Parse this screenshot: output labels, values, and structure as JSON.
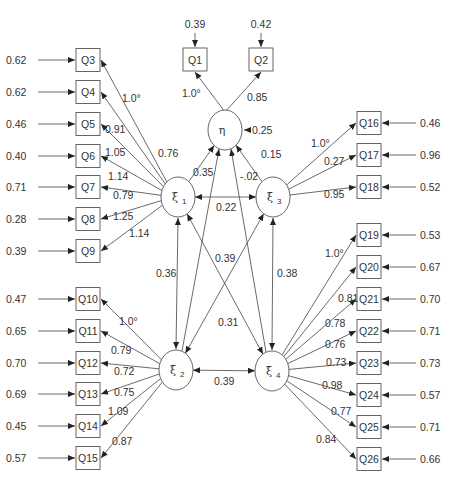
{
  "diagram": {
    "type": "structural-equation-model",
    "latents": [
      {
        "id": "eta",
        "label": "η",
        "cx": 225,
        "cy": 130,
        "error": "0.25"
      },
      {
        "id": "xi1",
        "label": "ξ",
        "sub": "1",
        "cx": 178,
        "cy": 197
      },
      {
        "id": "xi3",
        "label": "ξ",
        "sub": "3",
        "cx": 273,
        "cy": 197
      },
      {
        "id": "xi2",
        "label": "ξ",
        "sub": "2",
        "cx": 176,
        "cy": 370
      },
      {
        "id": "xi4",
        "label": "ξ",
        "sub": "4",
        "cx": 272,
        "cy": 371
      }
    ],
    "indicators_eta": [
      {
        "label": "Q1",
        "x": 183,
        "y": 48,
        "error": "0.39",
        "loading": "1.0*",
        "lx": 182,
        "ly": 97
      },
      {
        "label": "Q2",
        "x": 249,
        "y": 48,
        "error": "0.42",
        "loading": "0.85",
        "lx": 247,
        "ly": 101
      }
    ],
    "indicators_xi1": [
      {
        "label": "Q3",
        "cy": 60,
        "error": "0.62",
        "loading": "1.0*",
        "lx": 122,
        "ly": 102
      },
      {
        "label": "Q4",
        "cy": 92,
        "error": "0.62",
        "loading": "0.91",
        "lx": 105,
        "ly": 133
      },
      {
        "label": "Q5",
        "cy": 124,
        "error": "0.46",
        "loading": "1.05",
        "lx": 105,
        "ly": 156
      },
      {
        "label": "Q6",
        "cy": 156,
        "error": "0.40",
        "loading": "1.14",
        "lx": 108,
        "ly": 180
      },
      {
        "label": "Q7",
        "cy": 187,
        "error": "0.71",
        "loading": "0.79",
        "lx": 113,
        "ly": 199
      },
      {
        "label": "Q8",
        "cy": 219,
        "error": "0.28",
        "loading": "1.25",
        "lx": 113,
        "ly": 220
      },
      {
        "label": "Q9",
        "cy": 251,
        "error": "0.39",
        "loading": "1.14",
        "lx": 129,
        "ly": 237
      }
    ],
    "indicators_xi2": [
      {
        "label": "Q10",
        "cy": 299,
        "error": "0.47",
        "loading": "1.0*",
        "lx": 119,
        "ly": 325
      },
      {
        "label": "Q11",
        "cy": 331,
        "error": "0.65",
        "loading": "0.79",
        "lx": 111,
        "ly": 354
      },
      {
        "label": "Q12",
        "cy": 363,
        "error": "0.70",
        "loading": "0.72",
        "lx": 114,
        "ly": 375
      },
      {
        "label": "Q13",
        "cy": 394,
        "error": "0.69",
        "loading": "0.75",
        "lx": 114,
        "ly": 396
      },
      {
        "label": "Q14",
        "cy": 426,
        "error": "0.45",
        "loading": "1.09",
        "lx": 108,
        "ly": 415
      },
      {
        "label": "Q15",
        "cy": 458,
        "error": "0.57",
        "loading": "0.87",
        "lx": 112,
        "ly": 445
      }
    ],
    "indicators_xi3": [
      {
        "label": "Q16",
        "cy": 123,
        "error": "0.46",
        "loading": "1.0*",
        "lx": 311,
        "ly": 147
      },
      {
        "label": "Q17",
        "cy": 155,
        "error": "0.96",
        "loading": "0.27",
        "lx": 324,
        "ly": 165
      },
      {
        "label": "Q18",
        "cy": 187,
        "error": "0.52",
        "loading": "0.95",
        "lx": 324,
        "ly": 198
      }
    ],
    "indicators_xi4": [
      {
        "label": "Q19",
        "cy": 235,
        "error": "0.53",
        "loading": "1.0*",
        "lx": 325,
        "ly": 257
      },
      {
        "label": "Q20",
        "cy": 267,
        "error": "0.67",
        "loading": "0.81",
        "lx": 338,
        "ly": 302
      },
      {
        "label": "Q21",
        "cy": 299,
        "error": "0.70",
        "loading": "0.78",
        "lx": 325,
        "ly": 327
      },
      {
        "label": "Q22",
        "cy": 331,
        "error": "0.71",
        "loading": "0.76",
        "lx": 325,
        "ly": 348
      },
      {
        "label": "Q23",
        "cy": 363,
        "error": "0.73",
        "loading": "0.73",
        "lx": 326,
        "ly": 366
      },
      {
        "label": "Q24",
        "cy": 395,
        "error": "0.57",
        "loading": "0.98",
        "lx": 322,
        "ly": 389
      },
      {
        "label": "Q25",
        "cy": 427,
        "error": "0.71",
        "loading": "0.77",
        "lx": 331,
        "ly": 415
      },
      {
        "label": "Q26",
        "cy": 459,
        "error": "0.66",
        "loading": "0.84",
        "lx": 316,
        "ly": 443
      }
    ],
    "structural_paths": [
      {
        "from": "xi1",
        "to": "eta",
        "coef": "0.76",
        "lx": 158,
        "ly": 157
      },
      {
        "from": "xi2",
        "to": "eta",
        "coef": "0.35",
        "lx": 193,
        "ly": 176
      },
      {
        "from": "xi4",
        "to": "eta",
        "coef": "-.02",
        "lx": 240,
        "ly": 180
      },
      {
        "from": "xi3",
        "to": "eta",
        "coef": "0.15",
        "lx": 261,
        "ly": 158
      }
    ],
    "covariances": [
      {
        "a": "xi1",
        "b": "xi3",
        "coef": "0.22",
        "lx": 216,
        "ly": 211
      },
      {
        "a": "xi1",
        "b": "xi2",
        "coef": "0.36",
        "lx": 156,
        "ly": 277
      },
      {
        "a": "xi3",
        "b": "xi4",
        "coef": "0.38",
        "lx": 277,
        "ly": 277
      },
      {
        "a": "xi2",
        "b": "xi4",
        "coef": "0.39",
        "lx": 214,
        "ly": 385
      },
      {
        "a": "xi2",
        "b": "xi3",
        "coef": "0.39",
        "lx": 215,
        "ly": 262
      },
      {
        "a": "xi1",
        "b": "xi4",
        "coef": "0.31",
        "lx": 218,
        "ly": 326
      }
    ],
    "eta_error_label": "0.25"
  }
}
